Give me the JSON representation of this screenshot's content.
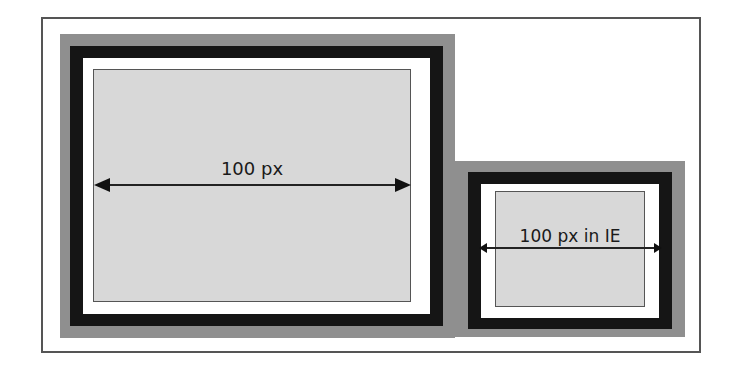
{
  "diagram": {
    "left_box": {
      "label": "100 px",
      "description": "Standard box model: width applies to content area"
    },
    "right_box": {
      "label": "100 px in IE",
      "description": "IE box model: width includes padding and border"
    },
    "colors": {
      "margin": "#8f8f8f",
      "border": "#151515",
      "padding": "#ffffff",
      "content": "#d8d8d8",
      "frame": "#555555"
    }
  }
}
